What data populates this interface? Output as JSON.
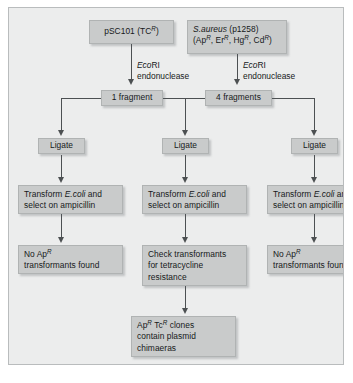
{
  "figure": {
    "colors": {
      "canvas": "#eceded",
      "box_fill": "#c9cbcb",
      "box_border": "#b0b3b3",
      "connector": "#4c5052",
      "text": "#16191a"
    }
  },
  "nodes": {
    "source_left": {
      "name": "pSC101 plasmid source",
      "line1_plain": "pSC101 (TC",
      "line1_sup": "R",
      "line1_tail": ")"
    },
    "source_right": {
      "name": "Staphylococcus aureus plasmid source",
      "line1_italic": "S.aureus",
      "line1_plain": " (p1258)",
      "line2_open": "(Ap",
      "sup1": "R",
      "sep1": ", Er",
      "sup2": "R",
      "sep2": ", Hg",
      "sup3": "R",
      "sep3": ", Cd",
      "sup4": "R",
      "line2_close": ")"
    },
    "fragments_left": {
      "label": "1 fragment"
    },
    "fragments_right": {
      "label": "4 fragments"
    },
    "ligate_left": {
      "label": "Ligate"
    },
    "ligate_middle": {
      "label": "Ligate"
    },
    "ligate_right": {
      "label": "Ligate"
    },
    "transform_left": {
      "line1_pre": "Transform ",
      "line1_italic": "E.coli",
      "line1_post": " and",
      "line2": "select on ampicillin"
    },
    "transform_middle": {
      "line1_pre": "Transform ",
      "line1_italic": "E.coli",
      "line1_post": " and",
      "line2": "select on ampicillin"
    },
    "transform_right": {
      "line1_pre": "Transform ",
      "line1_italic": "E.coli",
      "line1_post": " and",
      "line2": "select on ampicillin"
    },
    "result_left": {
      "line1_pre": "No Ap",
      "line1_sup": "R",
      "line2": "transformants found"
    },
    "result_middle": {
      "line1": "Check transformants",
      "line2": "for tetracycline",
      "line3": "resistance"
    },
    "result_right": {
      "line1_pre": "No Ap",
      "line1_sup": "R",
      "line2": "transformants found"
    },
    "conclusion": {
      "line1_pre": "Ap",
      "sup1": "R",
      "line1_mid": " Tc",
      "sup2": "R",
      "line1_post": " clones",
      "line2": "contain plasmid",
      "line3": "chimaeras"
    }
  },
  "captions": {
    "enzyme_left": {
      "italic": "Eco",
      "roman": "RI",
      "line2": "endonuclease"
    },
    "enzyme_right": {
      "italic": "Eco",
      "roman": "RI",
      "line2": "endonuclease"
    }
  }
}
